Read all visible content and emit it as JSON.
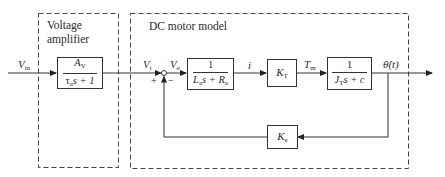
{
  "diagram": {
    "regions": {
      "amplifier": {
        "label_line1": "Voltage",
        "label_line2": "amplifier"
      },
      "motor": {
        "label": "DC motor model"
      }
    },
    "signals": {
      "input": {
        "sym": "V",
        "sub": "in"
      },
      "terminal_voltage": {
        "sym": "V",
        "sub": "t"
      },
      "error_voltage": {
        "sym": "V",
        "sub": "e"
      },
      "current": {
        "sym": "i"
      },
      "torque": {
        "sym": "T",
        "sub": "m"
      },
      "output": {
        "sym": "θ̇(t)"
      }
    },
    "summing_junction": {
      "plus": "+",
      "minus": "−"
    },
    "blocks": {
      "amplifier": {
        "num_sym": "A",
        "num_sub": "V",
        "den_a": "τ",
        "den_a_sub": "a",
        "den_rest": "s + 1"
      },
      "electrical": {
        "num": "1",
        "den_L": "L",
        "den_L_sub": "a",
        "den_mid": "s + ",
        "den_R": "R",
        "den_R_sub": "a"
      },
      "torque_const": {
        "sym": "K",
        "sub": "T"
      },
      "mechanical": {
        "num": "1",
        "den_J": "J",
        "den_J_sub": "T",
        "den_rest": "s + c"
      },
      "back_emf": {
        "sym": "K",
        "sub": "e"
      }
    },
    "colors": {
      "line": "#333333",
      "dash": "#444444",
      "background": "#ffffff"
    }
  }
}
